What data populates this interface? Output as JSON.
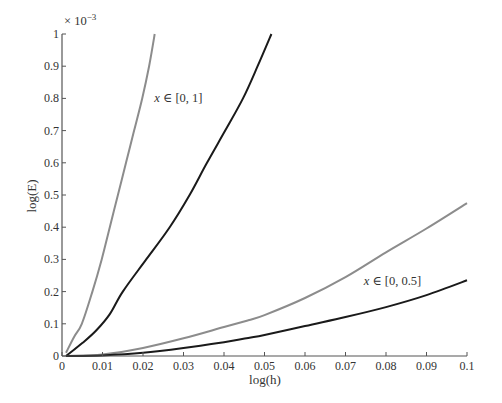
{
  "chart_data": {
    "type": "line",
    "title": "",
    "xlabel": "log(h)",
    "ylabel": "log(E)",
    "y_multiplier": "× 10",
    "y_multiplier_exp": "−3",
    "xlim": [
      0,
      0.1
    ],
    "ylim": [
      0,
      1
    ],
    "x_ticks": [
      0,
      0.01,
      0.02,
      0.03,
      0.04,
      0.05,
      0.06,
      0.07,
      0.08,
      0.09,
      0.1
    ],
    "x_tick_labels": [
      "0",
      "0.01",
      "0.02",
      "0.03",
      "0.04",
      "0.05",
      "0.06",
      "0.07",
      "0.08",
      "0.09",
      "0.1"
    ],
    "y_ticks": [
      0,
      0.1,
      0.2,
      0.3,
      0.4,
      0.5,
      0.6,
      0.7,
      0.8,
      0.9,
      1
    ],
    "y_tick_labels": [
      "0",
      "0.1",
      "0.2",
      "0.3",
      "0.4",
      "0.5",
      "0.6",
      "0.7",
      "0.8",
      "0.9",
      "1"
    ],
    "grid": false,
    "legend": "none",
    "annotations": [
      {
        "text": "x ∈ [0, 1]",
        "x": 0.0228,
        "y": 0.8
      },
      {
        "text": "x ∈ [0, 0.5]",
        "x": 0.0745,
        "y": 0.233
      }
    ],
    "series": [
      {
        "name": "x ∈ [0, 1] (gray)",
        "color": "#8c8c8c",
        "x": [
          0.001,
          0.003,
          0.0049,
          0.0075,
          0.0098,
          0.0118,
          0.0138,
          0.0158,
          0.0178,
          0.0198,
          0.0215,
          0.0229
        ],
        "y": [
          0.01,
          0.06,
          0.1,
          0.2,
          0.3,
          0.4,
          0.5,
          0.6,
          0.7,
          0.8,
          0.9,
          1.0
        ]
      },
      {
        "name": "x ∈ [0, 1] (black)",
        "color": "#1a1a1a",
        "x": [
          0.001,
          0.005,
          0.0085,
          0.0118,
          0.015,
          0.0208,
          0.0266,
          0.0315,
          0.0358,
          0.0403,
          0.0447,
          0.0483,
          0.0517
        ],
        "y": [
          0.0,
          0.04,
          0.08,
          0.13,
          0.2,
          0.3,
          0.4,
          0.5,
          0.6,
          0.7,
          0.8,
          0.9,
          1.0
        ]
      },
      {
        "name": "x ∈ [0, 0.5] (gray)",
        "color": "#8c8c8c",
        "x": [
          0.001,
          0.01,
          0.02,
          0.03,
          0.04,
          0.046,
          0.05,
          0.06,
          0.07,
          0.08,
          0.09,
          0.1
        ],
        "y": [
          0.0,
          0.005,
          0.025,
          0.055,
          0.09,
          0.111,
          0.127,
          0.18,
          0.245,
          0.322,
          0.396,
          0.475
        ]
      },
      {
        "name": "x ∈ [0, 0.5] (black)",
        "color": "#1a1a1a",
        "x": [
          0.001,
          0.01,
          0.02,
          0.03,
          0.04,
          0.046,
          0.05,
          0.06,
          0.07,
          0.08,
          0.09,
          0.1
        ],
        "y": [
          0.0,
          0.002,
          0.01,
          0.025,
          0.043,
          0.056,
          0.065,
          0.093,
          0.121,
          0.152,
          0.189,
          0.235
        ]
      }
    ]
  }
}
